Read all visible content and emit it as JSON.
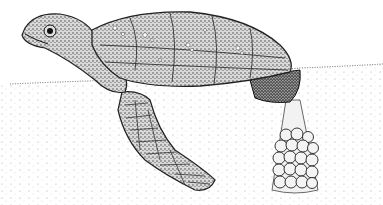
{
  "illustration": {
    "subject": "sea turtle laying eggs in sand nest",
    "style": "stipple pen-and-ink",
    "colors": {
      "background": "#ffffff",
      "ink": "#1a1a1a",
      "mid": "#6a6a6a",
      "light": "#c8c8c8",
      "sand": "#e8e8e8"
    }
  }
}
